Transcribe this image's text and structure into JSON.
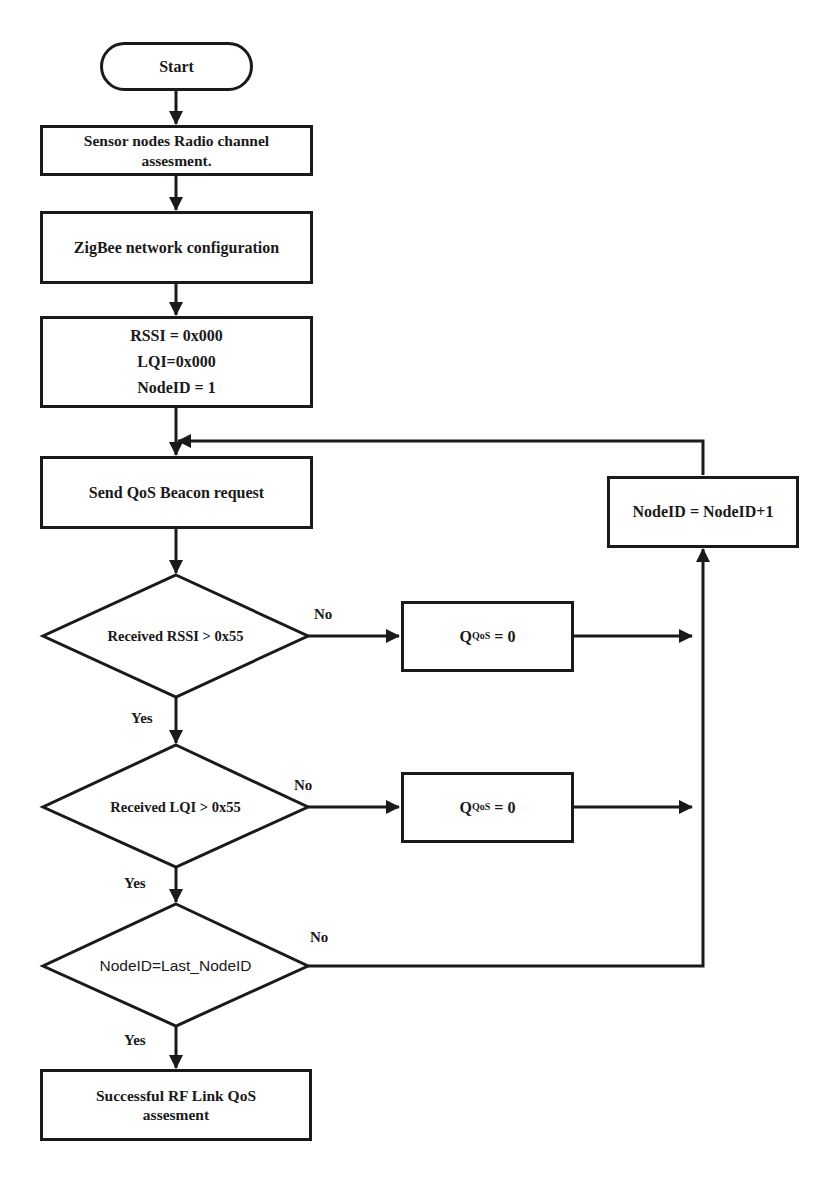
{
  "diagram": {
    "type": "flowchart",
    "nodes": {
      "start": {
        "label": "Start",
        "shape": "terminator"
      },
      "channel_assessment": {
        "line1": "Sensor nodes Radio channel",
        "line2": "assesment.",
        "shape": "process"
      },
      "zigbee_config": {
        "label": "ZigBee network configuration",
        "shape": "process"
      },
      "init_vars": {
        "line1": "RSSI = 0x000",
        "line2": "LQI=0x000",
        "line3": "NodeID = 1",
        "shape": "process"
      },
      "send_beacon": {
        "label": "Send QoS Beacon request",
        "shape": "process"
      },
      "check_rssi": {
        "label": "Received RSSI > 0x55",
        "shape": "decision"
      },
      "qos_zero_1": {
        "main": "Q",
        "sub": "QoS",
        "rest": " = 0",
        "shape": "process"
      },
      "check_lqi": {
        "label": "Received LQI > 0x55",
        "shape": "decision"
      },
      "qos_zero_2": {
        "main": "Q",
        "sub": "QoS",
        "rest": " = 0",
        "shape": "process"
      },
      "check_last": {
        "label": "NodeID=Last_NodeID",
        "shape": "decision"
      },
      "increment": {
        "label": "NodeID = NodeID+1",
        "shape": "process"
      },
      "end": {
        "line1": "Successful RF Link QoS",
        "line2": "assesment",
        "shape": "process"
      }
    },
    "edge_labels": {
      "rssi_no": "No",
      "rssi_yes": "Yes",
      "lqi_no": "No",
      "lqi_yes": "Yes",
      "last_no": "No",
      "last_yes": "Yes"
    },
    "edges": [
      [
        "start",
        "channel_assessment"
      ],
      [
        "channel_assessment",
        "zigbee_config"
      ],
      [
        "zigbee_config",
        "init_vars"
      ],
      [
        "init_vars",
        "send_beacon"
      ],
      [
        "send_beacon",
        "check_rssi"
      ],
      [
        "check_rssi",
        "qos_zero_1",
        "No"
      ],
      [
        "check_rssi",
        "check_lqi",
        "Yes"
      ],
      [
        "check_lqi",
        "qos_zero_2",
        "No"
      ],
      [
        "check_lqi",
        "check_last",
        "Yes"
      ],
      [
        "check_last",
        "increment",
        "No"
      ],
      [
        "check_last",
        "end",
        "Yes"
      ],
      [
        "qos_zero_1",
        "increment"
      ],
      [
        "qos_zero_2",
        "increment"
      ],
      [
        "increment",
        "send_beacon"
      ]
    ],
    "colors": {
      "stroke": "#1a1a1a",
      "background": "#ffffff"
    }
  }
}
